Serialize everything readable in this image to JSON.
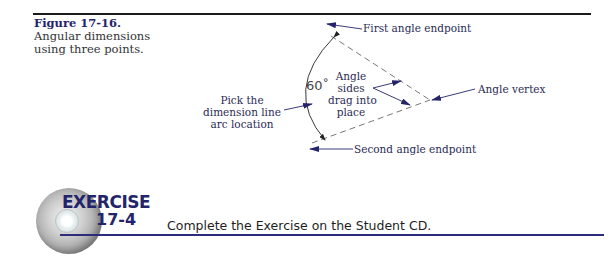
{
  "figure": {
    "number": "Figure 17-16.",
    "description_lines": [
      "Angular dimensions",
      "using three points."
    ]
  },
  "diagram": {
    "angle_value": "60˚",
    "labels": {
      "first_endpoint": "First angle endpoint",
      "second_endpoint": "Second angle endpoint",
      "vertex": "Angle vertex",
      "sides": [
        "Angle",
        "sides",
        "drag into",
        "place"
      ],
      "pick": [
        "Pick the",
        "dimension line",
        "arc location"
      ]
    }
  },
  "exercise": {
    "title": "EXERCISE",
    "number": "17-4",
    "instruction": "Complete the Exercise on the Student CD."
  },
  "colors": {
    "accent_navy": "#24246b",
    "rule_black": "#1a1a1a",
    "rule_blue": "#2c2c7a"
  }
}
